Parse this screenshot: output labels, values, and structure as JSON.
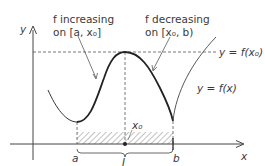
{
  "diagram": {
    "type": "function-graph",
    "axes": {
      "x_label": "x",
      "y_label": "y"
    },
    "annotations": {
      "increasing": {
        "line1": "f increasing",
        "line2": "on [a, x₀]"
      },
      "decreasing": {
        "line1": "f decreasing",
        "line2": "on [x₀, b)"
      },
      "max_line_label": "y = f(x₀)",
      "curve_label": "y = f(x)",
      "x0_label": "x₀",
      "a_label": "a",
      "b_label": "b",
      "interval_label": "I"
    },
    "colors": {
      "ink": "#3a3a3a",
      "curve": "#2a2a2a",
      "dashed": "#555555",
      "hatch": "#777777"
    }
  }
}
